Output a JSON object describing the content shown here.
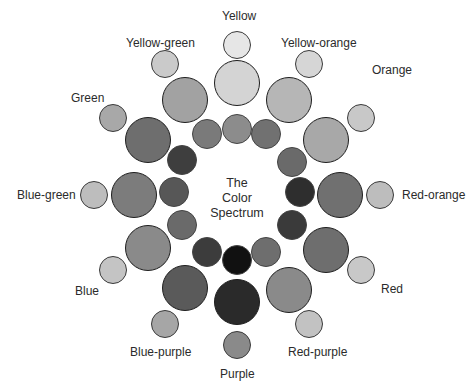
{
  "title": {
    "line1": "The",
    "line2": "Color",
    "line3": "Spectrum"
  },
  "spokes": [
    {
      "name": "Yellow",
      "label": "Yellow",
      "label_pos": [
        222,
        9
      ],
      "outer": {
        "x": 237,
        "y": 45,
        "r": 14,
        "color": "#e6e6e6"
      },
      "middle": {
        "x": 237,
        "y": 83,
        "r": 23,
        "color": "#d4d4d4"
      },
      "inner": {
        "x": 237,
        "y": 129,
        "r": 15,
        "color": "#8c8c8c"
      }
    },
    {
      "name": "Yellow-orange",
      "label": "Yellow-orange",
      "label_pos": [
        281,
        36
      ],
      "outer": {
        "x": 309,
        "y": 64,
        "r": 14,
        "color": "#d6d6d6"
      },
      "middle": {
        "x": 289,
        "y": 100,
        "r": 23,
        "color": "#b6b6b6"
      },
      "inner": {
        "x": 266,
        "y": 134,
        "r": 15,
        "color": "#717171"
      }
    },
    {
      "name": "Orange",
      "label": "Orange",
      "label_pos": [
        372,
        63
      ],
      "outer": {
        "x": 361,
        "y": 118,
        "r": 14,
        "color": "#c8c8c8"
      },
      "middle": {
        "x": 326,
        "y": 140,
        "r": 23,
        "color": "#a8a8a8"
      },
      "inner": {
        "x": 292,
        "y": 162,
        "r": 15,
        "color": "#6a6a6a"
      }
    },
    {
      "name": "Red-orange",
      "label": "Red-orange",
      "label_pos": [
        402,
        188
      ],
      "outer": {
        "x": 380,
        "y": 195,
        "r": 14,
        "color": "#bdbdbd"
      },
      "middle": {
        "x": 340,
        "y": 195,
        "r": 23,
        "color": "#707070"
      },
      "inner": {
        "x": 300,
        "y": 192,
        "r": 15,
        "color": "#2e2e2e"
      }
    },
    {
      "name": "Red",
      "label": "Red",
      "label_pos": [
        381,
        282
      ],
      "outer": {
        "x": 361,
        "y": 270,
        "r": 14,
        "color": "#c8c8c8"
      },
      "middle": {
        "x": 326,
        "y": 250,
        "r": 23,
        "color": "#6e6e6e"
      },
      "inner": {
        "x": 292,
        "y": 225,
        "r": 15,
        "color": "#3a3a3a"
      }
    },
    {
      "name": "Red-purple",
      "label": "Red-purple",
      "label_pos": [
        288,
        345
      ],
      "outer": {
        "x": 309,
        "y": 324,
        "r": 14,
        "color": "#c2c2c2"
      },
      "middle": {
        "x": 289,
        "y": 290,
        "r": 23,
        "color": "#8a8a8a"
      },
      "inner": {
        "x": 266,
        "y": 252,
        "r": 15,
        "color": "#6e6e6e"
      }
    },
    {
      "name": "Purple",
      "label": "Purple",
      "label_pos": [
        220,
        367
      ],
      "outer": {
        "x": 237,
        "y": 345,
        "r": 14,
        "color": "#8a8a8a"
      },
      "middle": {
        "x": 237,
        "y": 302,
        "r": 23,
        "color": "#2a2a2a"
      },
      "inner": {
        "x": 237,
        "y": 260,
        "r": 15,
        "color": "#111111"
      }
    },
    {
      "name": "Blue-purple",
      "label": "Blue-purple",
      "label_pos": [
        130,
        345
      ],
      "outer": {
        "x": 165,
        "y": 324,
        "r": 14,
        "color": "#a6a6a6"
      },
      "middle": {
        "x": 185,
        "y": 288,
        "r": 23,
        "color": "#5a5a5a"
      },
      "inner": {
        "x": 207,
        "y": 252,
        "r": 15,
        "color": "#3c3c3c"
      }
    },
    {
      "name": "Blue",
      "label": "Blue",
      "label_pos": [
        75,
        284
      ],
      "outer": {
        "x": 113,
        "y": 270,
        "r": 14,
        "color": "#c4c4c4"
      },
      "middle": {
        "x": 148,
        "y": 248,
        "r": 23,
        "color": "#8a8a8a"
      },
      "inner": {
        "x": 182,
        "y": 225,
        "r": 15,
        "color": "#6a6a6a"
      }
    },
    {
      "name": "Blue-green",
      "label": "Blue-green",
      "label_pos": [
        17,
        188
      ],
      "outer": {
        "x": 94,
        "y": 195,
        "r": 14,
        "color": "#bdbdbd"
      },
      "middle": {
        "x": 134,
        "y": 195,
        "r": 23,
        "color": "#7c7c7c"
      },
      "inner": {
        "x": 174,
        "y": 192,
        "r": 15,
        "color": "#575757"
      }
    },
    {
      "name": "Green",
      "label": "Green",
      "label_pos": [
        71,
        91
      ],
      "outer": {
        "x": 113,
        "y": 118,
        "r": 14,
        "color": "#a8a8a8"
      },
      "middle": {
        "x": 148,
        "y": 140,
        "r": 23,
        "color": "#6e6e6e"
      },
      "inner": {
        "x": 182,
        "y": 160,
        "r": 15,
        "color": "#3e3e3e"
      }
    },
    {
      "name": "Yellow-green",
      "label": "Yellow-green",
      "label_pos": [
        126,
        36
      ],
      "outer": {
        "x": 165,
        "y": 64,
        "r": 14,
        "color": "#cacaca"
      },
      "middle": {
        "x": 185,
        "y": 100,
        "r": 23,
        "color": "#a2a2a2"
      },
      "inner": {
        "x": 207,
        "y": 134,
        "r": 15,
        "color": "#7a7a7a"
      }
    }
  ]
}
